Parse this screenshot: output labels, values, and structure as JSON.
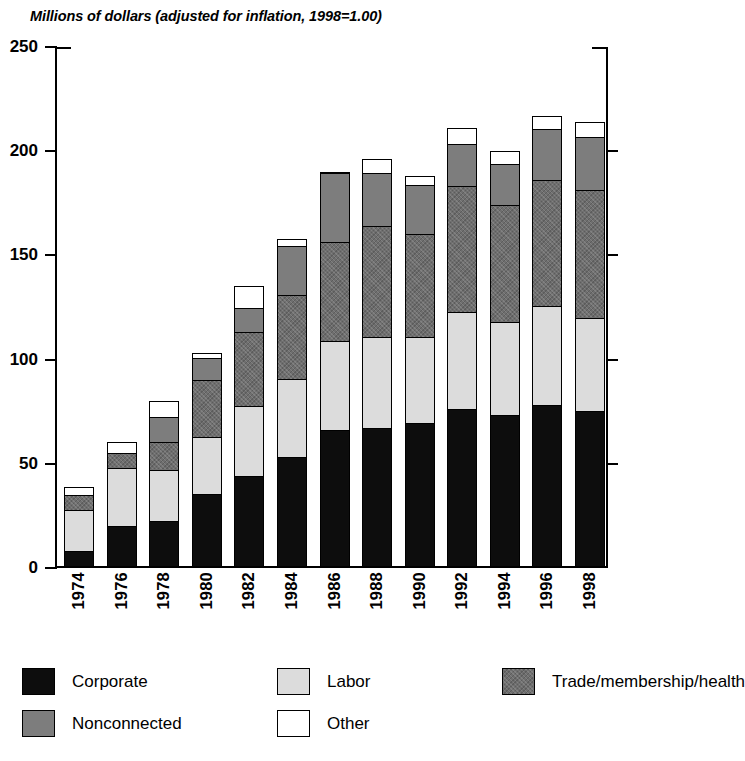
{
  "chart_data": {
    "type": "bar",
    "subtype": "stacked-bar",
    "title": "Millions of dollars (adjusted for inflation, 1998=1.00)",
    "xlabel": "",
    "ylabel": "",
    "ylim": [
      0,
      250
    ],
    "yticks": [
      0,
      50,
      100,
      150,
      200,
      250
    ],
    "grid": false,
    "legend_position": "bottom",
    "categories": [
      "1974",
      "1976",
      "1978",
      "1980",
      "1982",
      "1984",
      "1986",
      "1988",
      "1990",
      "1992",
      "1994",
      "1996",
      "1998"
    ],
    "series": [
      {
        "name": "Corporate",
        "color": "#0d0d0d",
        "values": [
          8,
          20,
          22,
          35,
          44,
          53,
          66,
          67,
          69,
          76,
          73,
          78,
          75
        ]
      },
      {
        "name": "Labor",
        "color": "#dcdcdc",
        "values": [
          20,
          28,
          25,
          28,
          34,
          38,
          43,
          44,
          42,
          47,
          45,
          48,
          45
        ]
      },
      {
        "name": "Trade/membership/health",
        "color": "#6e6e6e",
        "values": [
          8,
          8,
          14,
          28,
          36,
          41,
          48,
          54,
          50,
          61,
          57,
          61,
          62
        ]
      },
      {
        "name": "Nonconnected",
        "color": "#7d7d7d",
        "values": [
          0,
          0,
          13,
          11,
          12,
          24,
          34,
          26,
          24,
          21,
          20,
          25,
          26
        ]
      },
      {
        "name": "Other",
        "color": "#ffffff",
        "values": [
          4,
          6,
          8,
          3,
          11,
          4,
          1,
          7,
          5,
          8,
          7,
          7,
          8
        ]
      }
    ],
    "totals": [
      40,
      62,
      82,
      105,
      137,
      160,
      192,
      198,
      190,
      213,
      202,
      219,
      216
    ]
  },
  "legend": {
    "items": [
      {
        "label": "Corporate",
        "key": "corporate"
      },
      {
        "label": "Labor",
        "key": "labor"
      },
      {
        "label": "Trade/membership/health",
        "key": "trade"
      },
      {
        "label": "Nonconnected",
        "key": "nonconnected"
      },
      {
        "label": "Other",
        "key": "other"
      }
    ]
  }
}
